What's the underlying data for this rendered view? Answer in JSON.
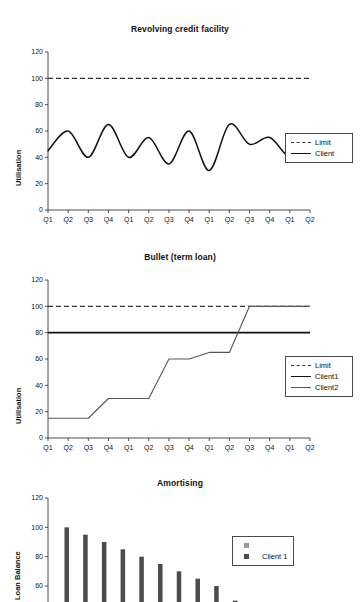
{
  "page": {
    "background": "#ffffff",
    "width": 360,
    "height": 602
  },
  "panels": [
    {
      "id": "revolving",
      "title": "Revolving credit facility",
      "ylabel": "Utilisation"
    },
    {
      "id": "bullet",
      "title": "Bullet (term loan)",
      "ylabel": "Utilisation"
    },
    {
      "id": "amortising",
      "title": "Amortising",
      "ylabel": "Loan Balance"
    }
  ],
  "legends": {
    "revolving": [
      {
        "label": "Limit",
        "style": "dashed",
        "color": "#333333"
      },
      {
        "label": "Client",
        "style": "solid",
        "color": "#111111"
      }
    ],
    "bullet": [
      {
        "label": "Limit",
        "style": "dashed",
        "color": "#333333"
      },
      {
        "label": "Client1",
        "style": "solid-thick",
        "color": "#111111"
      },
      {
        "label": "Client2",
        "style": "solid-thin",
        "color": "#555555"
      }
    ],
    "amortising": [
      {
        "label": "",
        "style": "square",
        "color": "#9a9a9a"
      },
      {
        "label": "Client 1",
        "style": "square",
        "color": "#4b4b4b"
      }
    ]
  },
  "chart_data": [
    {
      "type": "line",
      "id": "revolving",
      "title": "Revolving credit facility",
      "xlabel": "",
      "ylabel": "Utilisation",
      "ylim": [
        0,
        120
      ],
      "yticks": [
        0,
        20,
        40,
        60,
        80,
        100,
        120
      ],
      "grid": false,
      "legend_position": "right",
      "categories": [
        "Q1",
        "Q2",
        "Q3",
        "Q4",
        "Q1",
        "Q2",
        "Q3",
        "Q4",
        "Q1",
        "Q2",
        "Q3",
        "Q4",
        "Q1",
        "Q2"
      ],
      "series": [
        {
          "name": "Limit",
          "style": "dashed",
          "values": [
            100,
            100,
            100,
            100,
            100,
            100,
            100,
            100,
            100,
            100,
            100,
            100,
            100,
            100
          ]
        },
        {
          "name": "Client",
          "style": "solid",
          "values": [
            45,
            60,
            40,
            65,
            40,
            55,
            35,
            60,
            30,
            65,
            50,
            55,
            40,
            45
          ]
        }
      ]
    },
    {
      "type": "line",
      "id": "bullet",
      "title": "Bullet (term loan)",
      "xlabel": "",
      "ylabel": "Utilisation",
      "ylim": [
        0,
        120
      ],
      "yticks": [
        0,
        20,
        40,
        60,
        80,
        100,
        120
      ],
      "grid": false,
      "legend_position": "right",
      "categories": [
        "Q1",
        "Q2",
        "Q3",
        "Q4",
        "Q1",
        "Q2",
        "Q3",
        "Q4",
        "Q1",
        "Q2",
        "Q3",
        "Q4",
        "Q1",
        "Q2"
      ],
      "series": [
        {
          "name": "Limit",
          "style": "dashed",
          "values": [
            100,
            100,
            100,
            100,
            100,
            100,
            100,
            100,
            100,
            100,
            100,
            100,
            100,
            100
          ]
        },
        {
          "name": "Client1",
          "style": "solid-thick",
          "values": [
            80,
            80,
            80,
            80,
            80,
            80,
            80,
            80,
            80,
            80,
            80,
            80,
            80,
            80
          ]
        },
        {
          "name": "Client2",
          "style": "solid-thin",
          "values": [
            15,
            15,
            15,
            30,
            30,
            30,
            60,
            60,
            65,
            65,
            100,
            100,
            100,
            100
          ]
        }
      ]
    },
    {
      "type": "bar",
      "id": "amortising",
      "title": "Amortising",
      "xlabel": "",
      "ylabel": "Loan Balance",
      "ylim": [
        0,
        120
      ],
      "yticks": [
        40,
        60,
        80,
        100,
        120
      ],
      "grid": false,
      "legend_position": "right",
      "note": "bottom of plot cropped by screenshot edge",
      "categories": [
        "1",
        "2",
        "3",
        "4",
        "5",
        "6",
        "7",
        "8",
        "9",
        "10",
        "11",
        "12",
        "13"
      ],
      "values": [
        100,
        95,
        90,
        85,
        80,
        75,
        70,
        65,
        60,
        50,
        40,
        30,
        20
      ],
      "bar_color": "#4b4b4b"
    }
  ]
}
